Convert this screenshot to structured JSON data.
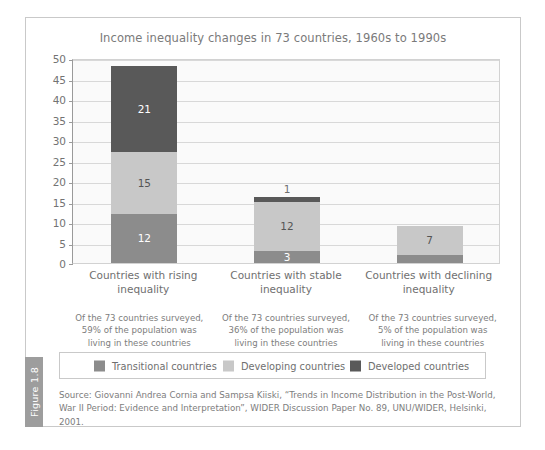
{
  "figure": {
    "tab_label": "Figure 1.8",
    "source_line_1": "Source: Giovanni Andrea Cornia and Sampsa Kiiski, “Trends in Income Distribution in the Post-World,",
    "source_line_2": "War II Period: Evidence and Interpretation”, WIDER Discussion Paper No. 89, UNU/WIDER, Helsinki, 2001."
  },
  "colors": {
    "transitional": "#8c8c8c",
    "developing": "#c8c8c8",
    "developed": "#595959",
    "plot_background": "#fafafa",
    "gridline": "#d8d8d8",
    "frame": "#c9c9c9",
    "text": "#6f6f6f",
    "tab_background": "#9d9d9d"
  },
  "chart_data": {
    "type": "bar",
    "stacked": true,
    "title": "Income inequality changes in 73 countries, 1960s to 1990s",
    "xlabel": "",
    "ylabel": "",
    "ylim": [
      0,
      50
    ],
    "yticks": [
      0,
      5,
      10,
      15,
      20,
      25,
      30,
      35,
      40,
      45,
      50
    ],
    "ytick_labels": [
      "0",
      "5",
      "10",
      "15",
      "20",
      "25",
      "30",
      "35",
      "40",
      "45",
      "50"
    ],
    "grid": true,
    "legend_position": "bottom",
    "categories": [
      "Countries with rising inequality",
      "Countries with stable inequality",
      "Countries with declining inequality"
    ],
    "series": [
      {
        "name": "Transitional countries",
        "color": "#8c8c8c",
        "values": [
          12,
          3,
          2
        ]
      },
      {
        "name": "Developing countries",
        "color": "#c8c8c8",
        "values": [
          15,
          12,
          7
        ]
      },
      {
        "name": "Developed countries",
        "color": "#595959",
        "values": [
          21,
          1,
          0
        ]
      }
    ],
    "totals": [
      48,
      16,
      9
    ],
    "annotations": [
      "Of the 73 countries surveyed, 59% of the population was living in these countries",
      "Of the 73 countries surveyed, 36% of the population was living in these countries",
      "Of the 73 countries surveyed, 5% of the population was living in these countries"
    ]
  },
  "categories_display": [
    {
      "line1": "Countries with rising",
      "line2": "inequality"
    },
    {
      "line1": "Countries with stable",
      "line2": "inequality"
    },
    {
      "line1": "Countries with declining",
      "line2": "inequality"
    }
  ],
  "notes_display": [
    {
      "line1": "Of the 73 countries surveyed,",
      "line2": "59% of the population was",
      "line3": "living in these countries"
    },
    {
      "line1": "Of the 73 countries surveyed,",
      "line2": "36% of the population was",
      "line3": "living in these countries"
    },
    {
      "line1": "Of the 73 countries surveyed,",
      "line2": "5% of the population was",
      "line3": "living in these countries"
    }
  ],
  "legend": {
    "items": [
      {
        "label": "Transitional countries",
        "color": "#8c8c8c"
      },
      {
        "label": "Developing countries",
        "color": "#c8c8c8"
      },
      {
        "label": "Developed countries",
        "color": "#595959"
      }
    ]
  }
}
